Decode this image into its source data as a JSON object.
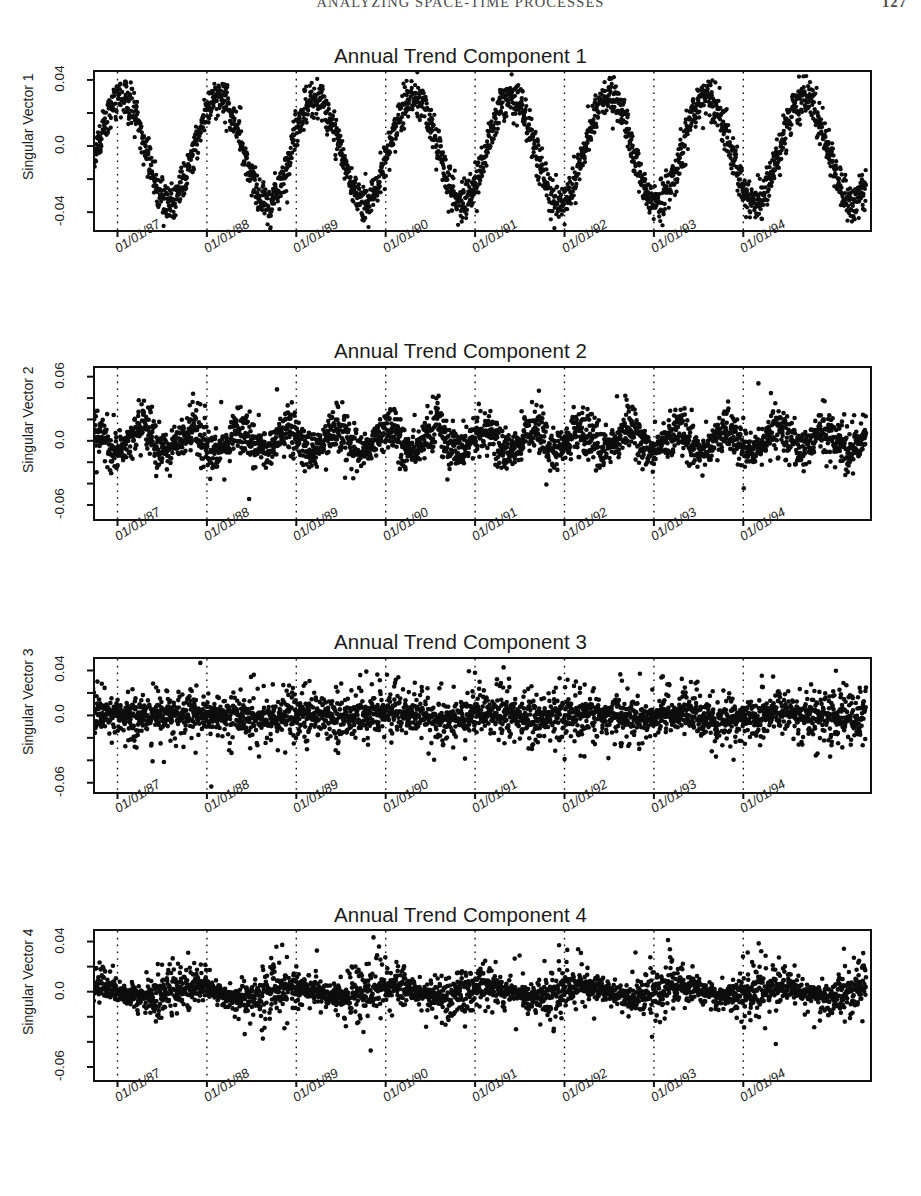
{
  "running_head": {
    "title": "ANALYZING SPACE-TIME PROCESSES",
    "page_number": "127"
  },
  "chart_data": [
    {
      "type": "scatter",
      "title": "Annual Trend Component 1",
      "xlabel": "",
      "ylabel": "Singular Vector 1",
      "ytick_labels": [
        "0.04",
        "0.0",
        "-0.04"
      ],
      "ytick_values": [
        0.04,
        0.0,
        -0.04
      ],
      "ylim": [
        -0.052,
        0.046
      ],
      "xtick_labels": [
        "01/01/87",
        "01/01/88",
        "01/01/89",
        "01/01/90",
        "01/01/91",
        "01/01/92",
        "01/01/93",
        "01/01/94"
      ],
      "xlim": [
        "1986-07-01",
        "1994-10-01"
      ],
      "grid": "vertical dotted at each year tick",
      "legend": "none",
      "description": "Dense daily scatter forming a strong regular annual sinusoid; peaks near +0.03 each summer, troughs near -0.035 each winter; roughly 8 complete cycles.",
      "seasonal_amplitude": 0.032,
      "seasonal_mean": -0.002,
      "noise_sigma": 0.006,
      "n_points": 2900,
      "cycles": 8.2
    },
    {
      "type": "scatter",
      "title": "Annual Trend Component 2",
      "xlabel": "",
      "ylabel": "Singular Vector 2",
      "ytick_labels": [
        "0.06",
        "0.0",
        "-0.06"
      ],
      "ytick_values": [
        0.06,
        0.0,
        -0.06
      ],
      "ylim": [
        -0.075,
        0.07
      ],
      "xtick_labels": [
        "01/01/87",
        "01/01/88",
        "01/01/89",
        "01/01/90",
        "01/01/91",
        "01/01/92",
        "01/01/93",
        "01/01/94"
      ],
      "xlim": [
        "1986-07-01",
        "1994-10-01"
      ],
      "grid": "vertical dotted at each year tick",
      "legend": "none",
      "description": "Noisy daily scatter centred on zero with intermittent semi-annual bursts; excursions reach about +0.06 and -0.065.",
      "seasonal_amplitude": 0.012,
      "seasonal_mean": 0.0,
      "noise_sigma": 0.012,
      "n_points": 2900,
      "cycles": 16.4
    },
    {
      "type": "scatter",
      "title": "Annual Trend Component 3",
      "xlabel": "",
      "ylabel": "Singular Vector 3",
      "ytick_labels": [
        "0.04",
        "0.0",
        "-0.06"
      ],
      "ytick_values": [
        0.04,
        0.0,
        -0.06
      ],
      "ylim": [
        -0.07,
        0.052
      ],
      "xtick_labels": [
        "01/01/87",
        "01/01/88",
        "01/01/89",
        "01/01/90",
        "01/01/91",
        "01/01/92",
        "01/01/93",
        "01/01/94"
      ],
      "xlim": [
        "1986-07-01",
        "1994-10-01"
      ],
      "grid": "vertical dotted at each year tick",
      "legend": "none",
      "description": "Broad noise cloud about zero with a dense dark core; scattered outliers out to roughly +0.05 and -0.06; very little periodic structure.",
      "seasonal_amplitude": 0.004,
      "seasonal_mean": 0.0,
      "noise_sigma": 0.014,
      "n_points": 2900,
      "cycles": 8.2
    },
    {
      "type": "scatter",
      "title": "Annual Trend Component 4",
      "xlabel": "",
      "ylabel": "Singular Vector 4",
      "ytick_labels": [
        "0.04",
        "0.0",
        "-0.06"
      ],
      "ytick_values": [
        0.04,
        0.0,
        -0.06
      ],
      "ylim": [
        -0.072,
        0.05
      ],
      "xtick_labels": [
        "01/01/87",
        "01/01/88",
        "01/01/89",
        "01/01/90",
        "01/01/91",
        "01/01/92",
        "01/01/93",
        "01/01/94"
      ],
      "xlim": [
        "1986-07-01",
        "1994-10-01"
      ],
      "grid": "vertical dotted at each year tick",
      "legend": "none",
      "description": "Noise cloud about zero with a weak repeating annual modulation; dense core with outliers near +0.045 and -0.065.",
      "seasonal_amplitude": 0.007,
      "seasonal_mean": 0.0,
      "noise_sigma": 0.013,
      "n_points": 2900,
      "cycles": 8.2
    }
  ]
}
